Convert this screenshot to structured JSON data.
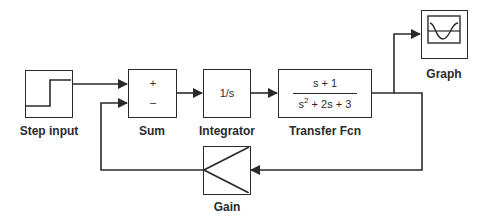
{
  "diagram": {
    "type": "simulink-block-diagram",
    "colors": {
      "line": "#2a2a2a",
      "background": "#ffffff"
    },
    "blocks": [
      {
        "id": "step",
        "label": "Step input",
        "icon": "step-signal-icon"
      },
      {
        "id": "sum",
        "label": "Sum",
        "ports": {
          "plus": "+",
          "minus": "–"
        }
      },
      {
        "id": "integrator",
        "label": "Integrator",
        "content": "1/s"
      },
      {
        "id": "tf",
        "label": "Transfer Fcn",
        "numerator": "s + 1",
        "denominator_parts": {
          "s": "s",
          "exp": "2",
          "rest": " + 2s + 3"
        }
      },
      {
        "id": "graph",
        "label": "Graph",
        "icon": "scope-sine-icon"
      },
      {
        "id": "gain",
        "label": "Gain",
        "icon": "gain-triangle-icon"
      }
    ],
    "connections": [
      {
        "from": "step",
        "to": "sum.plus"
      },
      {
        "from": "sum",
        "to": "integrator"
      },
      {
        "from": "integrator",
        "to": "tf"
      },
      {
        "from": "tf",
        "to": "graph"
      },
      {
        "from": "tf",
        "to": "gain"
      },
      {
        "from": "gain",
        "to": "sum.minus"
      }
    ]
  }
}
